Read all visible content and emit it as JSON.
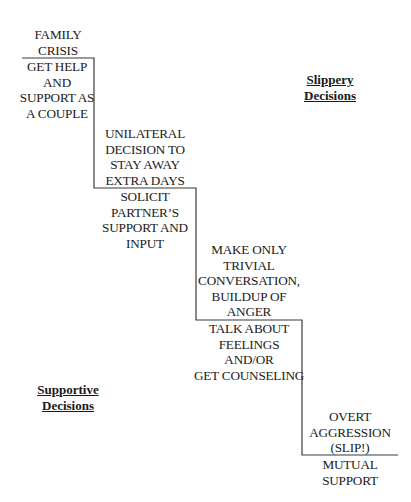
{
  "diagram": {
    "steps": [
      {
        "above": "FAMILY\nCRISIS",
        "below": "GET HELP\nAND\nSUPPORT AS\nA COUPLE"
      },
      {
        "above": "UNILATERAL\nDECISION TO\nSTAY AWAY\nEXTRA DAYS",
        "below": "SOLICIT\nPARTNER’S\nSUPPORT AND\nINPUT"
      },
      {
        "above": "MAKE ONLY\nTRIVIAL\nCONVERSATION,\nBUILDUP OF\nANGER",
        "below": "TALK ABOUT\nFEELINGS AND/OR\nGET COUNSELING"
      },
      {
        "above": "OVERT\nAGGRESSION\n(SLIP!)",
        "below": "MUTUAL\nSUPPORT"
      }
    ],
    "regions": {
      "slippery": "Slippery\nDecisions",
      "supportive": "Supportive\nDecisions"
    },
    "colors": {
      "line": "#333333",
      "text": "#1a1a1a",
      "background": "#ffffff"
    }
  }
}
